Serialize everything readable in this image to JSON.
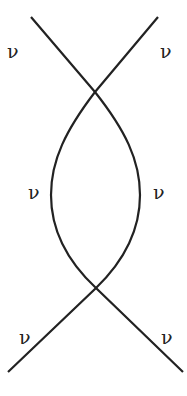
{
  "diagram": {
    "type": "feynman-diagram",
    "stroke_color": "#222222",
    "labels": [
      {
        "id": "top-left",
        "text": "ν"
      },
      {
        "id": "top-right",
        "text": "ν"
      },
      {
        "id": "mid-left",
        "text": "ν"
      },
      {
        "id": "mid-right",
        "text": "ν"
      },
      {
        "id": "bottom-left",
        "text": "ν"
      },
      {
        "id": "bottom-right",
        "text": "ν"
      }
    ]
  }
}
